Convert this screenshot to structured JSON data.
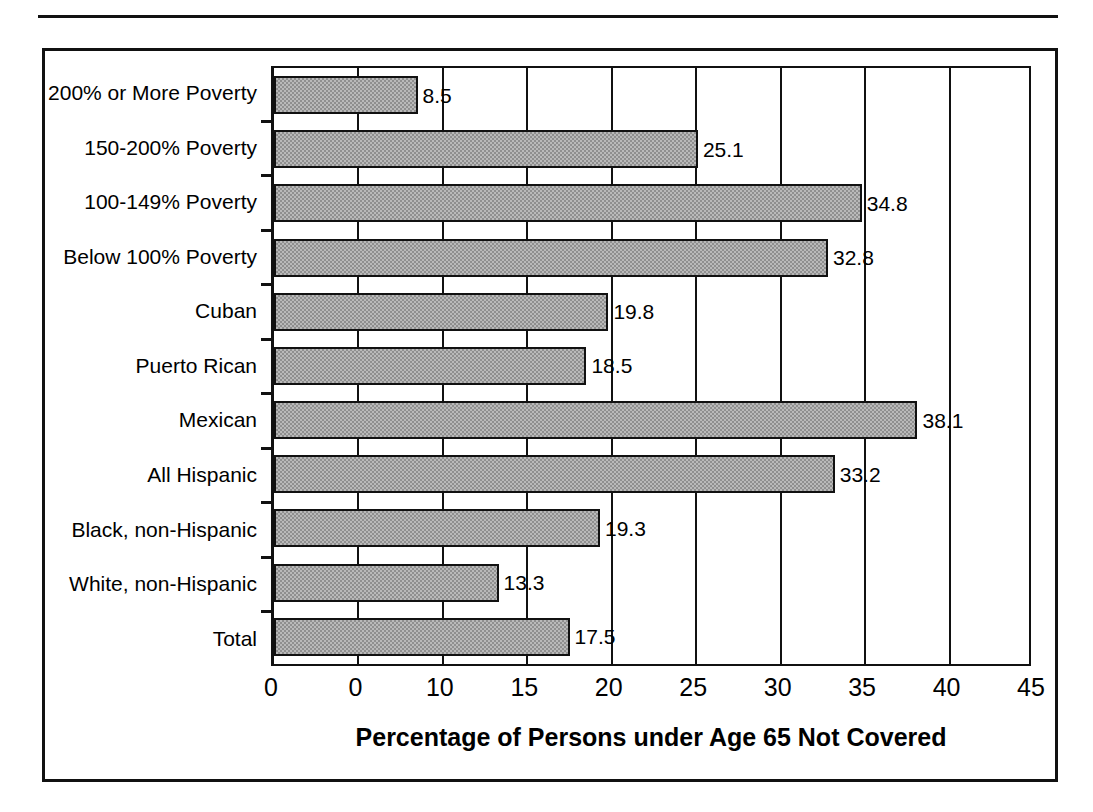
{
  "figure": {
    "has_top_rule": true,
    "border_color": "#111111",
    "background": "#ffffff"
  },
  "chart_data": {
    "type": "bar",
    "orientation": "horizontal",
    "title": "",
    "xlabel": "Percentage of Persons under Age 65 Not Covered",
    "ylabel": "",
    "xlim": [
      0,
      45
    ],
    "grid": true,
    "legend": null,
    "bar_fill_color": "#b9b9b9",
    "bar_edge_color": "#111111",
    "xticks": [
      "0",
      "0",
      "10",
      "15",
      "20",
      "25",
      "30",
      "35",
      "40",
      "45"
    ],
    "xtick_values": [
      0,
      5,
      10,
      15,
      20,
      25,
      30,
      35,
      40,
      45
    ],
    "categories": [
      "200% or More Poverty",
      "150-200% Poverty",
      "100-149% Poverty",
      "Below 100% Poverty",
      "Cuban",
      "Puerto Rican",
      "Mexican",
      "All Hispanic",
      "Black, non-Hispanic",
      "White, non-Hispanic",
      "Total"
    ],
    "values": [
      8.5,
      25.1,
      34.8,
      32.8,
      19.8,
      18.5,
      38.1,
      33.2,
      19.3,
      13.3,
      17.5
    ],
    "value_labels": [
      "8.5",
      "25.1",
      "34.8",
      "32.8",
      "19.8",
      "18.5",
      "38.1",
      "33.2",
      "19.3",
      "13.3",
      "17.5"
    ]
  }
}
